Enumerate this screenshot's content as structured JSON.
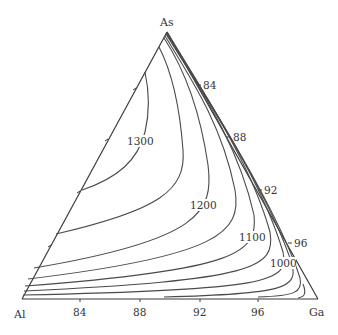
{
  "diagram": {
    "type": "ternary-liquidus-projection",
    "vertices": {
      "top": "As",
      "left": "Al",
      "right": "Ga"
    },
    "bottom_axis_ticks": [
      "84",
      "88",
      "92",
      "96"
    ],
    "right_axis_ticks": [
      "84",
      "88",
      "92",
      "96"
    ],
    "isotherm_labels": {
      "t1300": "1300",
      "t1200": "1200",
      "t1100": "1100",
      "t1000": "1000"
    },
    "colors": {
      "line": "#4a4a4a",
      "text": "#333333",
      "background": "#ffffff"
    }
  }
}
